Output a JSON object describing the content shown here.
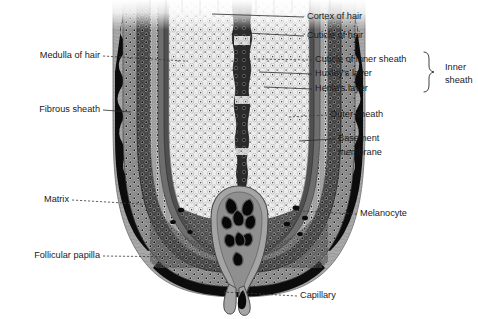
{
  "figure": {
    "background_color": "#ffffff",
    "text_color": "#1a1a1a",
    "leader_color": "#2a2a2a"
  },
  "labels": {
    "left": [
      {
        "id": "medulla-of-hair",
        "text": "Medulla of hair",
        "x": 100,
        "y": 56,
        "leader": "dashed",
        "tip_x": 185,
        "tip_y": 62
      },
      {
        "id": "fibrous-sheath",
        "text": "Fibrous sheath",
        "x": 100,
        "y": 110,
        "leader": "solid",
        "tip_x": 131,
        "tip_y": 112
      },
      {
        "id": "matrix",
        "text": "Matrix",
        "x": 69,
        "y": 200,
        "leader": "dashed",
        "tip_x": 155,
        "tip_y": 205
      },
      {
        "id": "follicular-papilla",
        "text": "Follicular papilla",
        "x": 100,
        "y": 256,
        "leader": "dashed",
        "tip_x": 185,
        "tip_y": 258
      }
    ],
    "right": [
      {
        "id": "cortex-of-hair",
        "text": "Cortex of hair",
        "x": 307,
        "y": 17,
        "leader": "solid",
        "tip_x": 210,
        "tip_y": 14
      },
      {
        "id": "cuticle-of-hair",
        "text": "Cuticle of hair",
        "x": 307,
        "y": 36,
        "leader": "solid",
        "tip_x": 243,
        "tip_y": 33
      },
      {
        "id": "cuticle-of-inner-sheath",
        "text": "Cuticle of inner sheath",
        "x": 315,
        "y": 60,
        "leader": "dashed",
        "tip_x": 252,
        "tip_y": 59
      },
      {
        "id": "huxleys-layer",
        "text": "Huxley's layer",
        "x": 315,
        "y": 74,
        "leader": "solid",
        "tip_x": 257,
        "tip_y": 72
      },
      {
        "id": "henles-layer",
        "text": "Henle's layer",
        "x": 315,
        "y": 89,
        "leader": "solid",
        "tip_x": 262,
        "tip_y": 87
      },
      {
        "id": "outer-sheath",
        "text": "Outer sheath",
        "x": 330,
        "y": 115,
        "leader": "dashed",
        "tip_x": 285,
        "tip_y": 117
      },
      {
        "id": "basement-membrane-1",
        "text": "Basement",
        "x": 338,
        "y": 139,
        "leader": "solid",
        "tip_x": 296,
        "tip_y": 140
      },
      {
        "id": "basement-membrane-2",
        "text": "membrane",
        "x": 338,
        "y": 153,
        "leader": "none"
      },
      {
        "id": "melanocyte",
        "text": "Melanocyte",
        "x": 360,
        "y": 214,
        "leader": "dashed",
        "tip_x": 298,
        "tip_y": 211
      },
      {
        "id": "capillary",
        "text": "Capillary",
        "x": 300,
        "y": 296,
        "leader": "dashed",
        "tip_x": 222,
        "tip_y": 292
      }
    ],
    "group": {
      "id": "inner-sheath",
      "line1": "Inner",
      "line2": "sheath",
      "x": 445,
      "y1": 68,
      "y2": 81,
      "brace_top": 52,
      "brace_bottom": 95,
      "brace_x": 428
    }
  },
  "anatomy": {
    "layers": [
      {
        "name": "fibrous-sheath",
        "color": "#9c9c9c"
      },
      {
        "name": "basement-membrane",
        "color": "#111111"
      },
      {
        "name": "outer-sheath",
        "color": "#6d6d6d"
      },
      {
        "name": "henles-layer",
        "color": "#3a3a3a"
      },
      {
        "name": "huxleys-layer",
        "color": "#8a8a8a"
      },
      {
        "name": "cuticle-of-inner-sheath",
        "color": "#5a5a5a"
      },
      {
        "name": "cuticle-of-hair",
        "color": "#4a4a4a"
      },
      {
        "name": "cortex-of-hair",
        "color": "#e8e8e8"
      },
      {
        "name": "medulla-of-hair",
        "color": "#2e2e2e"
      },
      {
        "name": "matrix",
        "color": "#7a7a7a"
      },
      {
        "name": "follicular-papilla",
        "color": "#9a9a9a"
      },
      {
        "name": "capillary",
        "color": "#0d0d0d"
      },
      {
        "name": "melanocyte",
        "color": "#141414"
      }
    ]
  }
}
